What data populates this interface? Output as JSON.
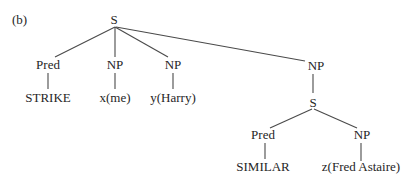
{
  "figure_label": "(b)",
  "tree": {
    "nodes": [
      {
        "id": "S0",
        "label": "S",
        "x": 114,
        "y": 24
      },
      {
        "id": "Pred1",
        "label": "Pred",
        "x": 48,
        "y": 69
      },
      {
        "id": "NP1",
        "label": "NP",
        "x": 115,
        "y": 69
      },
      {
        "id": "NP2",
        "label": "NP",
        "x": 173,
        "y": 69
      },
      {
        "id": "NP3",
        "label": "NP",
        "x": 316,
        "y": 70
      },
      {
        "id": "STRIKE",
        "label": "STRIKE",
        "x": 48,
        "y": 102
      },
      {
        "id": "xme",
        "label": "x(me)",
        "x": 115,
        "y": 102
      },
      {
        "id": "yHarry",
        "label": "y(Harry)",
        "x": 173,
        "y": 102
      },
      {
        "id": "S1",
        "label": "S",
        "x": 313,
        "y": 107
      },
      {
        "id": "Pred2",
        "label": "Pred",
        "x": 263,
        "y": 139
      },
      {
        "id": "NP4",
        "label": "NP",
        "x": 362,
        "y": 139
      },
      {
        "id": "SIMILAR",
        "label": "SIMILAR",
        "x": 263,
        "y": 171
      },
      {
        "id": "zFred",
        "label": "z(Fred Astaire)",
        "x": 361,
        "y": 171
      }
    ],
    "edges": [
      {
        "x1": 115,
        "y1": 27,
        "x2": 55,
        "y2": 57
      },
      {
        "x1": 115,
        "y1": 27,
        "x2": 115,
        "y2": 57
      },
      {
        "x1": 115,
        "y1": 27,
        "x2": 168,
        "y2": 57
      },
      {
        "x1": 116,
        "y1": 27,
        "x2": 305,
        "y2": 61
      },
      {
        "x1": 48,
        "y1": 73,
        "x2": 48,
        "y2": 89
      },
      {
        "x1": 115,
        "y1": 73,
        "x2": 115,
        "y2": 89
      },
      {
        "x1": 173,
        "y1": 73,
        "x2": 173,
        "y2": 89
      },
      {
        "x1": 313,
        "y1": 74,
        "x2": 313,
        "y2": 93
      },
      {
        "x1": 312,
        "y1": 109,
        "x2": 270,
        "y2": 128
      },
      {
        "x1": 314,
        "y1": 109,
        "x2": 357,
        "y2": 128
      },
      {
        "x1": 265,
        "y1": 143,
        "x2": 265,
        "y2": 159
      },
      {
        "x1": 361,
        "y1": 143,
        "x2": 361,
        "y2": 161
      }
    ]
  }
}
